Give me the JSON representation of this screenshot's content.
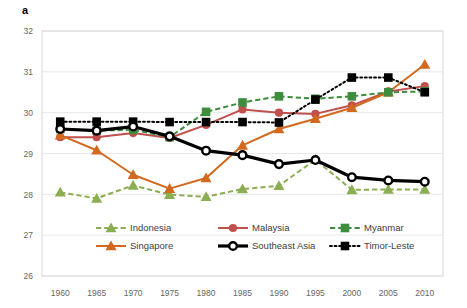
{
  "panel": {
    "label": "a"
  },
  "chart_data": {
    "type": "line",
    "title": "",
    "xlabel": "",
    "ylabel": "",
    "x": [
      1960,
      1965,
      1970,
      1975,
      1980,
      1985,
      1990,
      1995,
      2000,
      2005,
      2010
    ],
    "xtick_labels": [
      "1960",
      "1965",
      "1970",
      "1975",
      "1980",
      "1985",
      "1990",
      "1995",
      "2000",
      "2005",
      "2010"
    ],
    "ytick_labels": [
      "26",
      "27",
      "28",
      "29",
      "30",
      "31",
      "32"
    ],
    "yticks": [
      26,
      27,
      28,
      29,
      30,
      31,
      32
    ],
    "ylim": [
      26,
      32
    ],
    "xlim": [
      1957.5,
      2012.5
    ],
    "grid": "horizontal",
    "legend_position": "inside-bottom-center",
    "series": [
      {
        "name": "Indonesia",
        "color": "#8CAE52",
        "marker": "triangle",
        "line_style": "dashed",
        "line_width": 2,
        "values": [
          28.05,
          27.9,
          28.22,
          27.99,
          27.94,
          28.13,
          28.21,
          28.85,
          28.11,
          28.12,
          28.12
        ]
      },
      {
        "name": "Malaysia",
        "color": "#C0504D",
        "marker": "circle",
        "line_style": "solid",
        "line_width": 2,
        "values": [
          29.4,
          29.4,
          29.5,
          29.38,
          29.7,
          30.08,
          30.0,
          29.97,
          30.18,
          30.52,
          30.65
        ]
      },
      {
        "name": "Myanmar",
        "color": "#3E8C3E",
        "marker": "square",
        "line_style": "dashed",
        "line_width": 2,
        "values": [
          29.6,
          29.56,
          29.58,
          29.4,
          30.02,
          30.25,
          30.4,
          30.34,
          30.4,
          30.5,
          30.52
        ]
      },
      {
        "name": "Singapore",
        "color": "#D2691E",
        "marker": "triangle",
        "line_style": "solid",
        "line_width": 2,
        "values": [
          29.45,
          29.08,
          28.48,
          28.14,
          28.4,
          29.2,
          29.6,
          29.85,
          30.12,
          30.5,
          31.18
        ]
      },
      {
        "name": "Southeast Asia",
        "color": "#000000",
        "marker": "open-circle",
        "line_style": "solid",
        "line_width": 3.2,
        "values": [
          29.6,
          29.56,
          29.66,
          29.42,
          29.07,
          28.96,
          28.74,
          28.84,
          28.42,
          28.34,
          28.31
        ]
      },
      {
        "name": "Timor-Leste",
        "color": "#000000",
        "marker": "square",
        "line_style": "dotted",
        "line_width": 2,
        "values": [
          29.78,
          29.78,
          29.78,
          29.77,
          29.77,
          29.77,
          29.76,
          30.32,
          30.86,
          30.86,
          30.5
        ]
      }
    ],
    "series_order_draw": [
      "Indonesia",
      "Malaysia",
      "Singapore",
      "Myanmar",
      "Timor-Leste",
      "Southeast Asia"
    ]
  },
  "legend": {
    "rows": [
      [
        "Indonesia",
        "Malaysia",
        "Myanmar"
      ],
      [
        "Singapore",
        "Southeast Asia",
        "Timor-Leste"
      ]
    ]
  },
  "style": {
    "plot_border_color": "#D9D9D9",
    "grid_color": "#E8E8E8",
    "background": "#FFFFFF",
    "tick_text_color": "#666666"
  }
}
